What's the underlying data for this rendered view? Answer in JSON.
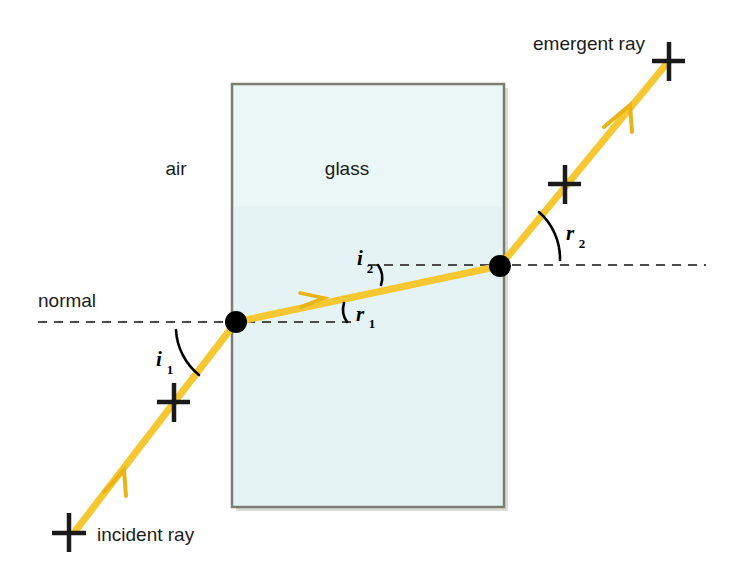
{
  "diagram": {
    "colors": {
      "ray": "#f5c731",
      "ray_edge": "#e8b417",
      "glass_fill": "#e6f3f5",
      "glass_border": "#7d7d74",
      "normal_dash": "#4b4b4b",
      "text": "#1b1b1b",
      "point": "#000000",
      "background": "#ffffff"
    },
    "media": {
      "left_label": "air",
      "block_label": "glass"
    },
    "normal_label": "normal",
    "rays": {
      "incident_label": "incident ray",
      "emergent_label": "emergent ray"
    },
    "angles": [
      {
        "name": "i1",
        "symbol": "i",
        "subscript": "1",
        "meaning": "angle of incidence at air-glass boundary"
      },
      {
        "name": "r1",
        "symbol": "r",
        "subscript": "1",
        "meaning": "angle of refraction inside glass"
      },
      {
        "name": "i2",
        "symbol": "i",
        "subscript": "2",
        "meaning": "angle of incidence at glass-air boundary"
      },
      {
        "name": "r2",
        "symbol": "r",
        "subscript": "2",
        "meaning": "angle of refraction into air"
      }
    ],
    "glass_block": {
      "x": 232,
      "y": 84,
      "width": 272,
      "height": 423
    },
    "points": {
      "entry": {
        "x": 236,
        "y": 322
      },
      "exit": {
        "x": 500,
        "y": 266
      }
    },
    "normals": {
      "lower": {
        "x1": 38,
        "y": 322,
        "x2": 352
      },
      "upper": {
        "x1": 368,
        "y": 265,
        "x2": 706
      }
    }
  }
}
